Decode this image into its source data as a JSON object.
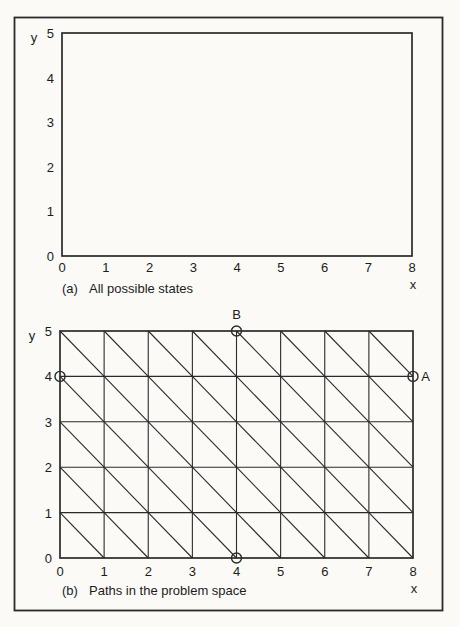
{
  "page": {
    "background_color": "#fbfaf7",
    "ink_color": "#2a2a2a",
    "text_color": "#1c1c1c"
  },
  "figure": {
    "panels": [
      {
        "id": "a",
        "caption_label": "(a)",
        "caption_text": "All possible states",
        "x_axis": {
          "label": "x",
          "min": 0,
          "max": 8,
          "ticks": [
            "0",
            "1",
            "2",
            "3",
            "4",
            "5",
            "6",
            "7",
            "8"
          ]
        },
        "y_axis": {
          "label": "y",
          "min": 0,
          "max": 5,
          "ticks": [
            "5",
            "4",
            "3",
            "2",
            "1",
            "0"
          ]
        },
        "grid_lines": false,
        "cell_diagonals": false,
        "markers": []
      },
      {
        "id": "b",
        "caption_label": "(b)",
        "caption_text": "Paths in the problem space",
        "x_axis": {
          "label": "x",
          "min": 0,
          "max": 8,
          "ticks": [
            "0",
            "1",
            "2",
            "3",
            "4",
            "5",
            "6",
            "7",
            "8"
          ]
        },
        "y_axis": {
          "label": "y",
          "min": 0,
          "max": 5,
          "ticks": [
            "5",
            "4",
            "3",
            "2",
            "1",
            "0"
          ]
        },
        "grid_lines": true,
        "cell_diagonals": "top-left-to-bottom-right",
        "markers": [
          {
            "x": 0,
            "y": 4,
            "label": "",
            "label_side": null
          },
          {
            "x": 4,
            "y": 5,
            "label": "B",
            "label_side": "above"
          },
          {
            "x": 8,
            "y": 4,
            "label": "A",
            "label_side": "right"
          },
          {
            "x": 4,
            "y": 0,
            "label": "",
            "label_side": null
          }
        ]
      }
    ]
  },
  "chart_data": [
    {
      "type": "grid-diagram",
      "title": "(a) All possible states",
      "xlabel": "x",
      "ylabel": "y",
      "xlim": [
        0,
        8
      ],
      "ylim": [
        0,
        5
      ],
      "grid": false,
      "points": []
    },
    {
      "type": "grid-diagram",
      "title": "(b) Paths in the problem space",
      "xlabel": "x",
      "ylabel": "y",
      "xlim": [
        0,
        8
      ],
      "ylim": [
        0,
        5
      ],
      "grid": true,
      "diagonals": "every unit cell has a diagonal from top-left to bottom-right",
      "points": [
        {
          "x": 0,
          "y": 4,
          "label": ""
        },
        {
          "x": 4,
          "y": 5,
          "label": "B"
        },
        {
          "x": 8,
          "y": 4,
          "label": "A"
        },
        {
          "x": 4,
          "y": 0,
          "label": ""
        }
      ]
    }
  ]
}
